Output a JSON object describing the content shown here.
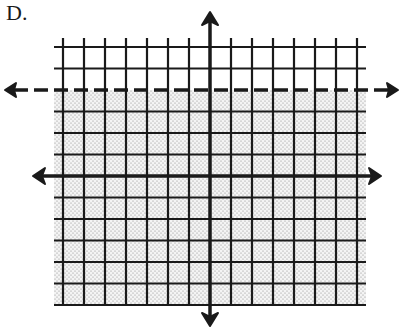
{
  "label": "D.",
  "chart_data": {
    "type": "inequality-graph",
    "title": "D.",
    "inequality": "y < 4",
    "boundary": {
      "equation": "y = 4",
      "style": "dashed",
      "arrows": true
    },
    "shaded_region": "below boundary",
    "grid": {
      "x_range": [
        -7,
        7
      ],
      "y_range": [
        -6,
        6
      ],
      "step": 1,
      "grid_on": true
    },
    "axes": {
      "x_arrows": true,
      "y_arrows": true,
      "tick_labels": false
    },
    "colors": {
      "grid": "#1a1a1a",
      "shade_dots": "#8a8a8a",
      "background": "#ffffff"
    }
  }
}
